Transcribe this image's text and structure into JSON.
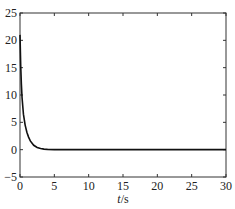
{
  "chart_data": {
    "type": "line",
    "title": "",
    "xlabel": "t/s",
    "xlabel_italic_part": "t",
    "xlabel_unit_part": "/s",
    "ylabel": "",
    "xlim": [
      0,
      30
    ],
    "ylim": [
      -5,
      25
    ],
    "x_ticks": [
      0,
      5,
      10,
      15,
      20,
      25,
      30
    ],
    "y_ticks": [
      -5,
      0,
      5,
      10,
      15,
      20,
      25
    ],
    "x_tick_labels": [
      "0",
      "5",
      "10",
      "15",
      "20",
      "25",
      "30"
    ],
    "y_tick_labels": [
      "-5",
      "0",
      "5",
      "10",
      "15",
      "20",
      "25"
    ],
    "grid": false,
    "legend": null,
    "series": [
      {
        "name": "response",
        "color": "#111111",
        "x": [
          0,
          0.1,
          0.2,
          0.3,
          0.5,
          0.75,
          1.0,
          1.25,
          1.5,
          2.0,
          2.5,
          3.0,
          3.5,
          4.0,
          5.0,
          6.0,
          8.0,
          10.0,
          15.0,
          20.0,
          25.0,
          30.0
        ],
        "y": [
          21,
          15.5,
          12,
          9.5,
          6.5,
          4.5,
          3.2,
          2.3,
          1.6,
          0.8,
          0.4,
          0.2,
          0.1,
          0.05,
          0.0,
          0.0,
          0.0,
          0.0,
          0.0,
          0.0,
          0.0,
          0.0
        ]
      }
    ]
  }
}
